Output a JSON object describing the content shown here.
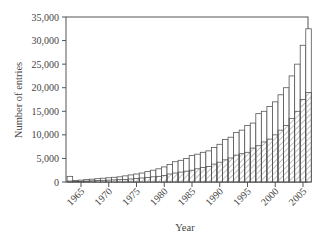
{
  "chart_data": {
    "type": "bar",
    "title": "",
    "xlabel": "Year",
    "ylabel": "Number of entries",
    "ylim": [
      0,
      35000
    ],
    "yticks": [
      0,
      5000,
      10000,
      15000,
      20000,
      25000,
      30000,
      35000
    ],
    "ytick_labels": [
      "0",
      "5,000",
      "10,000",
      "15,000",
      "20,000",
      "25,000",
      "30,000",
      "35,000"
    ],
    "xticks": [
      1965,
      1970,
      1975,
      1980,
      1985,
      1990,
      1995,
      2000,
      2005
    ],
    "xtick_labels": [
      "1965",
      "1970",
      "1975",
      "1980",
      "1985",
      "1990",
      "1995",
      "2000",
      "2005"
    ],
    "grid": false,
    "legend": null,
    "bar_style": "overlaid: total as open bars, subset as hatched bars",
    "categories": [
      1963,
      1964,
      1965,
      1966,
      1967,
      1968,
      1969,
      1970,
      1971,
      1972,
      1973,
      1974,
      1975,
      1976,
      1977,
      1978,
      1979,
      1980,
      1981,
      1982,
      1983,
      1984,
      1985,
      1986,
      1987,
      1988,
      1989,
      1990,
      1991,
      1992,
      1993,
      1994,
      1995,
      1996,
      1997,
      1998,
      1999,
      2000,
      2001,
      2002,
      2003,
      2004,
      2005,
      2006
    ],
    "series": [
      {
        "name": "Total entries",
        "style": "open",
        "values": [
          1200,
          300,
          400,
          500,
          600,
          700,
          800,
          900,
          1000,
          1100,
          1300,
          1500,
          1700,
          1900,
          2200,
          2500,
          2800,
          3200,
          3700,
          4300,
          4600,
          5000,
          5600,
          5900,
          6300,
          6600,
          7300,
          8000,
          9000,
          9500,
          10500,
          11000,
          12000,
          12500,
          14500,
          15000,
          16000,
          17000,
          18500,
          20000,
          22500,
          25000,
          29000,
          32500
        ]
      },
      {
        "name": "Subset",
        "style": "hatched",
        "values": [
          200,
          100,
          150,
          200,
          250,
          300,
          350,
          400,
          450,
          500,
          550,
          650,
          750,
          850,
          950,
          1100,
          1200,
          1400,
          1700,
          1900,
          2100,
          2300,
          2500,
          2800,
          3100,
          3300,
          3800,
          4200,
          4700,
          5100,
          5700,
          6000,
          6300,
          7200,
          7700,
          8500,
          9100,
          10000,
          11000,
          12000,
          13500,
          15000,
          17500,
          19000
        ]
      }
    ]
  }
}
